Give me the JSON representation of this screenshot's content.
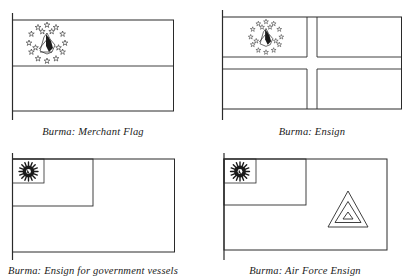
{
  "colors": {
    "line": "#2a2a2a",
    "background": "#ffffff",
    "emblem": "#1a1a1a"
  },
  "flags": [
    {
      "id": "merchant-flag",
      "caption": "Burma: Merchant Flag",
      "design": "horizontal bicolour with star-ring emblem in upper hoist"
    },
    {
      "id": "ensign",
      "caption": "Burma: Ensign",
      "design": "cross with star-ring emblem in canton"
    },
    {
      "id": "government-ensign",
      "caption": "Burma: Ensign for government vessels",
      "design": "plain field with canton containing small emblem box"
    },
    {
      "id": "air-force-ensign",
      "caption": "Burma: Air Force Ensign",
      "design": "plain field with canton and concentric triangle roundel in fly"
    }
  ]
}
